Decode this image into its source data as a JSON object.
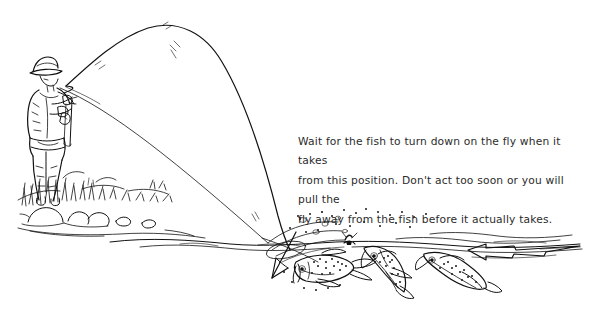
{
  "illustration": {
    "title": "fly-fishing-take-diagram",
    "description": "Pen-and-ink line drawing of an angler on a grassy bank with a deeply bent fly rod, the line entering the water, a downward arrow at the fly, three spotted trout near the surface and a current arrow flowing left.",
    "background_color": "#ffffff",
    "ink_color": "#111111",
    "elements": {
      "angler": "fisherman-with-hat-holding-bent-fly-rod",
      "rod": "deeply-bent-fly-rod-arc",
      "line": "fly-line-descending-to-water",
      "bank": "grass-tufts-and-rocks",
      "water_surface": "wavy-waterline",
      "fly": "dry-fly-on-surface",
      "take_arrow": "downward-arrow-at-fly",
      "current_arrow": "left-pointing-current-arrow",
      "fish": [
        "trout-turning-down-left",
        "trout-rising-center",
        "trout-holding-right"
      ]
    }
  },
  "caption": {
    "text": "Wait for the fish to turn down on the fly when it takes\nfrom this position. Don't act too soon or you will pull the\nfly away from the fish before it actually takes.",
    "color": "#2b2b2b"
  }
}
